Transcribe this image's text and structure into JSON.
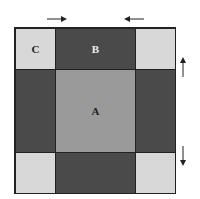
{
  "labels": {
    "a": "A",
    "b": "B",
    "c": "C"
  },
  "colors": {
    "light": "#d8d8d8",
    "dark": "#4a4a4a",
    "mid": "#9a9a9a"
  },
  "arrows": [
    "right-arrow top-left",
    "left-arrow top-right",
    "up-arrow right-upper",
    "down-arrow right-lower"
  ]
}
